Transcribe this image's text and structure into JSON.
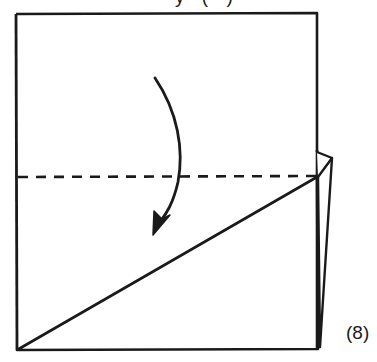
{
  "diagram": {
    "type": "origami-fold-instruction",
    "step_number_label": "(8)",
    "top_caption_partial": "y (·)",
    "fold": {
      "kind": "valley-fold",
      "direction": "down",
      "fold_line_style": "dashed"
    },
    "colors": {
      "ink": "#1a1a1a",
      "paper": "#ffffff"
    }
  }
}
